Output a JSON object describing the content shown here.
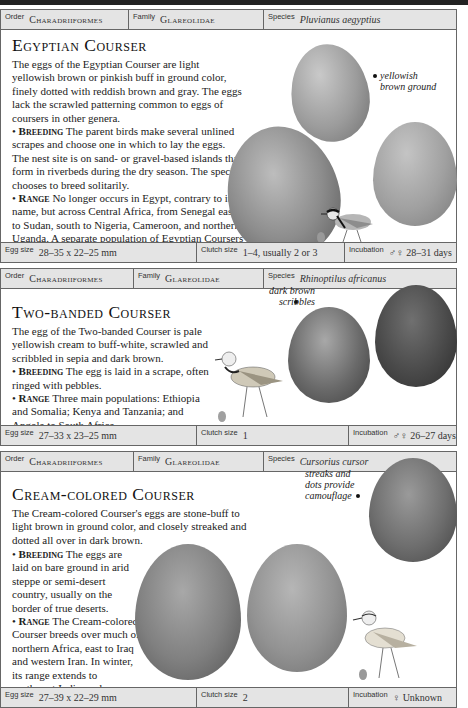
{
  "entries": [
    {
      "order_label": "Order",
      "order": "Charadriiformes",
      "family_label": "Family",
      "family": "Glareolidae",
      "species_label": "Species",
      "species": "Pluvianus aegyptius",
      "title": "Egyptian Courser",
      "description": "The eggs of the Egyptian Courser are light yellowish brown or pinkish buff in ground color, finely dotted with reddish brown and gray. The eggs lack the scrawled patterning common to eggs of coursers in other genera.",
      "breeding_label": "Breeding",
      "breeding": "The parent birds make several unlined scrapes and choose one in which to lay the eggs. The nest site is on sand- or gravel-based islands that form in riverbeds during the dry season. The species chooses to breed solitarily.",
      "range_label": "Range",
      "range": "No longer occurs in Egypt, contrary to its name, but across Central Africa, from Senegal east to Sudan, south to Nigeria, Cameroon, and northern Uganda. A separate population of Egyptian Coursers inhabits northern Angola and western Zaire.",
      "annotation": "yellowish brown ground",
      "egg_size_label": "Egg size",
      "egg_size": "28–35 x 22–25 mm",
      "clutch_size_label": "Clutch size",
      "clutch_size": "1–4, usually 2 or 3",
      "incubation_label": "Incubation",
      "incubation": "♂♀ 28–31 days"
    },
    {
      "order_label": "Order",
      "order": "Charadriiformes",
      "family_label": "Family",
      "family": "Glareolidae",
      "species_label": "Species",
      "species": "Rhinoptilus africanus",
      "title": "Two-banded Courser",
      "description": "The egg of the Two-banded Courser is pale yellowish cream to buff-white, scrawled and scribbled in sepia and dark brown.",
      "breeding_label": "Breeding",
      "breeding": "The egg is laid in a scrape, often ringed with pebbles.",
      "range_label": "Range",
      "range": "Three main populations: Ethiopia and Somalia; Kenya and Tanzania; and Angola to South Africa.",
      "annotation": "dark brown scribbles",
      "egg_size_label": "Egg size",
      "egg_size": "27–33 x 23–25 mm",
      "clutch_size_label": "Clutch size",
      "clutch_size": "1",
      "incubation_label": "Incubation",
      "incubation": "♂♀ 26–27 days"
    },
    {
      "order_label": "Order",
      "order": "Charadriiformes",
      "family_label": "Family",
      "family": "Glareolidae",
      "species_label": "Species",
      "species": "Cursorius cursor",
      "title": "Cream-colored Courser",
      "description": "The Cream-colored Courser's eggs are stone-buff to light brown in ground color, and closely streaked and dotted all over in dark brown.",
      "breeding_label": "Breeding",
      "breeding": "The eggs are laid on bare ground in arid steppe or semi-desert country, usually on the border of true deserts.",
      "range_label": "Range",
      "range": "The Cream-colored Courser breeds over much of northern Africa, east to Iraq and western Iran. In winter, its range extends to northwest India, and sometimes Europe.",
      "annotation": "streaks and dots provide camouflage",
      "egg_size_label": "Egg size",
      "egg_size": "27–39 x 22–29 mm",
      "clutch_size_label": "Clutch size",
      "clutch_size": "2",
      "incubation_label": "Incubation",
      "incubation": "♀ Unknown"
    }
  ]
}
